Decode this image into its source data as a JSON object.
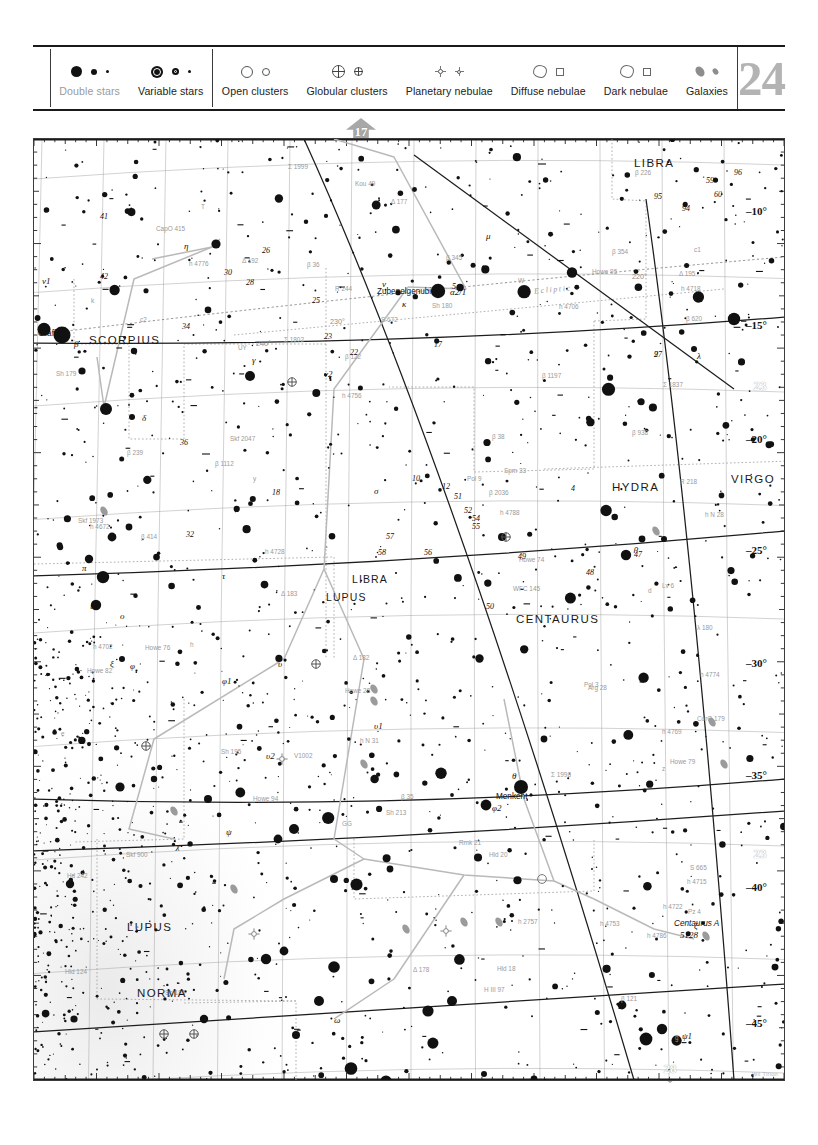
{
  "chart": {
    "number": "24",
    "credit": "Wil Tirion"
  },
  "legend": {
    "items": [
      {
        "id": "double-stars",
        "label": "Double stars",
        "faded": true
      },
      {
        "id": "variable-stars",
        "label": "Variable stars",
        "faded": false
      },
      {
        "id": "open-clusters",
        "label": "Open clusters",
        "faded": false
      },
      {
        "id": "globular-clusters",
        "label": "Globular clusters",
        "faded": false
      },
      {
        "id": "planetary-nebulae",
        "label": "Planetary nebulae",
        "faded": false
      },
      {
        "id": "diffuse-nebulae",
        "label": "Diffuse nebulae",
        "faded": false
      },
      {
        "id": "dark-nebulae",
        "label": "Dark nebulae",
        "faded": false
      },
      {
        "id": "galaxies",
        "label": "Galaxies",
        "faded": false
      }
    ]
  },
  "navigation": {
    "top": "17",
    "bottom": "28",
    "right_upper": "23",
    "right_lower": "23"
  },
  "axes": {
    "ra_top": [
      {
        "label": "16",
        "unit": "h",
        "big": true,
        "x": 60
      },
      {
        "label": "40",
        "unit": "m",
        "big": false,
        "x": 182
      },
      {
        "label": "20",
        "unit": "m",
        "big": false,
        "x": 300
      },
      {
        "label": "15",
        "unit": "h",
        "big": true,
        "x": 417
      },
      {
        "label": "40",
        "unit": "m",
        "big": false,
        "x": 530
      },
      {
        "label": "20",
        "unit": "m",
        "big": false,
        "x": 640
      }
    ],
    "ra_bottom": [
      {
        "label": "16",
        "unit": "h",
        "big": true,
        "x": 62
      },
      {
        "label": "40",
        "unit": "m",
        "big": false,
        "x": 172
      },
      {
        "label": "20",
        "unit": "m",
        "big": false,
        "x": 278
      },
      {
        "label": "15",
        "unit": "h",
        "big": true,
        "x": 382
      },
      {
        "label": "40",
        "unit": "m",
        "big": false,
        "x": 487
      },
      {
        "label": "20",
        "unit": "m",
        "big": false,
        "x": 590
      },
      {
        "label": "14",
        "unit": "h",
        "big": true,
        "x": 690
      }
    ],
    "dec_right": [
      "-10°",
      "-15°",
      "-20°",
      "-25°",
      "-30°",
      "-35°",
      "-40°",
      "-45°"
    ]
  },
  "chart_data": {
    "type": "scatter",
    "xlabel": "Right Ascension",
    "ylabel": "Declination",
    "xlim": [
      "16h 00m",
      "13h 50m"
    ],
    "ylim": [
      "-08°",
      "-46°"
    ],
    "grid": true,
    "legend_position": "top",
    "constellations": [
      {
        "name": "LIBRA",
        "x": 625,
        "y": 25
      },
      {
        "name": "SCORPIUS",
        "x": 62,
        "y": 202
      },
      {
        "name": "HYDRA",
        "x": 595,
        "y": 350
      },
      {
        "name": "VIRGO",
        "x": 715,
        "y": 342
      },
      {
        "name": "LIBRA",
        "x": 325,
        "y": 440
      },
      {
        "name": "LUPUS",
        "x": 300,
        "y": 458
      },
      {
        "name": "CENTAURUS",
        "x": 510,
        "y": 480
      },
      {
        "name": "LUPUS",
        "x": 120,
        "y": 790
      },
      {
        "name": "NORMA",
        "x": 130,
        "y": 855
      }
    ],
    "named_stars": [
      {
        "name": "Graffias",
        "x": 38,
        "y": 196
      },
      {
        "name": "Zubenelgenubi",
        "x": 395,
        "y": 152
      },
      {
        "name": "Menkent",
        "x": 488,
        "y": 650
      },
      {
        "name": "Centaurus A",
        "x": 690,
        "y": 790
      }
    ],
    "greek_labels": [
      "α2/1",
      "β",
      "γ",
      "δ",
      "η",
      "θ",
      "ι",
      "κ",
      "λ",
      "μ",
      "ν",
      "ν1",
      "ν2",
      "ξ",
      "ο",
      "π",
      "ρ",
      "σ",
      "τ",
      "υ",
      "υ1",
      "υ2",
      "φ",
      "φ1",
      "φ2",
      "χ",
      "ψ",
      "ψ1",
      "ψ2",
      "ω",
      "ζ",
      "ε"
    ],
    "flamsteed_labels": [
      "2",
      "4",
      "5",
      "10",
      "12",
      "17",
      "18",
      "22",
      "23",
      "25",
      "26",
      "28",
      "30",
      "32",
      "34",
      "36",
      "41",
      "42",
      "47",
      "48",
      "49",
      "50",
      "51",
      "52",
      "54",
      "55",
      "56",
      "57",
      "58",
      "59",
      "60",
      "94",
      "95",
      "96",
      "97"
    ],
    "deep_sky_objects": [
      {
        "id": "5897",
        "type": "globular-cluster",
        "x": 258,
        "y": 243
      },
      {
        "id": "5824",
        "type": "globular-cluster",
        "x": 282,
        "y": 525
      },
      {
        "id": "5694",
        "type": "globular-cluster",
        "x": 472,
        "y": 398
      },
      {
        "id": "5986",
        "type": "globular-cluster",
        "x": 112,
        "y": 607
      },
      {
        "id": "5946",
        "type": "globular-cluster",
        "x": 130,
        "y": 895
      },
      {
        "id": "5927",
        "type": "globular-cluster",
        "x": 160,
        "y": 895
      },
      {
        "id": "5882",
        "type": "planetary-nebula",
        "x": 220,
        "y": 795
      },
      {
        "id": "5873",
        "type": "planetary-nebula",
        "x": 248,
        "y": 620
      },
      {
        "id": "5643",
        "type": "galaxy",
        "x": 372,
        "y": 790
      },
      {
        "id": "5530",
        "type": "galaxy",
        "x": 430,
        "y": 783
      },
      {
        "id": "5483",
        "type": "galaxy",
        "x": 465,
        "y": 783
      },
      {
        "id": "5367",
        "type": "diffuse-nebula",
        "x": 508,
        "y": 740
      },
      {
        "id": "5253",
        "type": "galaxy",
        "x": 678,
        "y": 583
      },
      {
        "id": "5128",
        "type": "galaxy",
        "x": 672,
        "y": 797
      },
      {
        "id": "I.4406",
        "type": "planetary-nebula",
        "x": 412,
        "y": 792
      },
      {
        "id": "I.4696",
        "type": "galaxy",
        "x": 690,
        "y": 625
      },
      {
        "id": "I 226",
        "type": "galaxy",
        "x": 340,
        "y": 550
      },
      {
        "id": "I 227",
        "type": "galaxy",
        "x": 340,
        "y": 562
      },
      {
        "id": "I 228",
        "type": "galaxy",
        "x": 200,
        "y": 750
      },
      {
        "id": "I 84",
        "type": "galaxy",
        "x": 330,
        "y": 625
      },
      {
        "id": "I 89",
        "type": "galaxy",
        "x": 140,
        "y": 672
      },
      {
        "id": "I 977",
        "type": "galaxy",
        "x": 70,
        "y": 372
      },
      {
        "id": "UC 2694",
        "type": "galaxy",
        "x": 622,
        "y": 392
      },
      {
        "id": "Lal 123",
        "type": "double-star",
        "x": 172,
        "y": 315
      },
      {
        "id": "Bvd 108",
        "type": "double-star",
        "x": 508,
        "y": 25
      }
    ],
    "double_star_labels": [
      "Σ 1998",
      "Σ 1999",
      "Σ 1837",
      "Σ 1802",
      "Sh 213",
      "Sh 195",
      "Sh 186",
      "Sh 179",
      "Sh 180",
      "β 35",
      "β 36",
      "β 38",
      "β 121",
      "β 122",
      "β 226",
      "β 239",
      "β 345",
      "β 354",
      "β 414",
      "β 620",
      "β 938",
      "β 1112",
      "β 1197",
      "β 2036",
      "h 4769",
      "h 4756",
      "h 4774",
      "h 4722",
      "h 4718",
      "h 4702",
      "h 4728",
      "h 4706",
      "h 4715",
      "h 4753",
      "h 4776",
      "h 4786",
      "h 4788",
      "h 4672",
      "h 2757",
      "h N 28",
      "h N 31",
      "H III 97",
      "Hld 18",
      "Hld 20",
      "Hld 124",
      "Hd 242",
      "Howe 74",
      "Howe 76",
      "Howe 79",
      "Howe 82",
      "Howe 94",
      "Howe 95",
      "Howe 28",
      "Kou 49",
      "Pz 4",
      "Rmk 21",
      "Skf 2047",
      "Skf 1973",
      "Skf 900",
      "Spm 33",
      "CorO 179",
      "CapO 415",
      "WFC 145",
      "Pol 9",
      "Pol 3",
      "R 244",
      "R 218",
      "Arg 28",
      "Lv 6",
      "S 665",
      "S 672",
      "Δ 183",
      "Δ 178",
      "Δ 177",
      "Δ 182",
      "Δ 192",
      "Δ 195",
      "λ 180",
      "UY",
      "W",
      "GG",
      "V1002",
      "T",
      "d",
      "e",
      "g",
      "h",
      "k",
      "z",
      "y",
      "c1",
      "c2"
    ],
    "reference_lines": [
      {
        "name": "Ecliptic",
        "style": "dotted",
        "label": "Ecliptic"
      },
      {
        "name": "ecliptic-longitude-220",
        "label": "220°"
      },
      {
        "name": "ecliptic-longitude-240",
        "label": "240°"
      },
      {
        "name": "ecliptic-longitude-230",
        "label": "230°"
      },
      {
        "name": "galactic-equator",
        "style": "solid"
      },
      {
        "name": "constellation-boundaries",
        "style": "dotted"
      }
    ]
  }
}
